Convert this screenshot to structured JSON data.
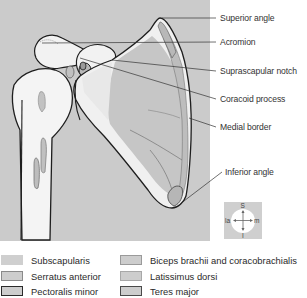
{
  "colors": {
    "panel_bg": "#cbcbcb",
    "bone": "#f3f3f3",
    "muscle_fill": "#c4c4c4",
    "outline": "#1e1e1e",
    "leader": "#333333"
  },
  "labels": [
    {
      "id": "superior-angle",
      "text": "Superior angle",
      "x": 220,
      "y": 13
    },
    {
      "id": "acromion",
      "text": "Acromion",
      "x": 220,
      "y": 37
    },
    {
      "id": "suprascapular-notch",
      "text": "Suprascapular notch",
      "x": 220,
      "y": 66
    },
    {
      "id": "coracoid-process",
      "text": "Coracoid process",
      "x": 220,
      "y": 94
    },
    {
      "id": "medial-border",
      "text": "Medial border",
      "x": 220,
      "y": 122
    },
    {
      "id": "inferior-angle",
      "text": "Inferior angle",
      "x": 225,
      "y": 167
    }
  ],
  "compass": {
    "superior": "S",
    "inferior": "I",
    "lateral": "la",
    "medial": "m"
  },
  "legend": {
    "left": [
      {
        "label": "Subscapularis",
        "fill": "#cfcfcf",
        "border": "#cfcfcf"
      },
      {
        "label": "Serratus anterior",
        "fill": "#cdcdcd",
        "border": "#8a8a8a"
      },
      {
        "label": "Pectoralis minor",
        "fill": "#cdcdcd",
        "border": "#2a2a2a"
      }
    ],
    "right": [
      {
        "label": "Biceps brachii and coracobrachialis",
        "fill": "#cdcdcd",
        "border": "#9a9a9a"
      },
      {
        "label": "Latissimus dorsi",
        "fill": "#cdcdcd",
        "border": "#a8a8a8"
      },
      {
        "label": "Teres major",
        "fill": "#cdcdcd",
        "border": "#4a4a4a"
      }
    ]
  }
}
